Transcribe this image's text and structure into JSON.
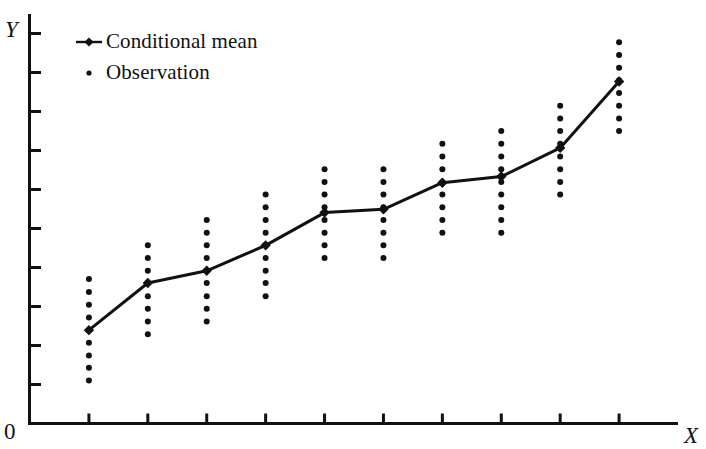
{
  "figure": {
    "axis_y_label": "Y",
    "axis_x_label": "X",
    "origin_label": "0"
  },
  "legend": {
    "position": "top-left inside plot",
    "items": [
      {
        "label": "Conditional mean",
        "marker": "line-with-diamond-marker",
        "color": "#111111"
      },
      {
        "label": "Observation",
        "marker": "small-dot",
        "color": "#111111"
      }
    ]
  },
  "chart_data": {
    "type": "scatter",
    "title": "",
    "subtitle": "",
    "xlabel": "X",
    "ylabel": "Y",
    "xlim": [
      0,
      11
    ],
    "ylim": [
      0,
      10
    ],
    "grid": false,
    "legend_position": "top-left",
    "axis_ticks_x_count": 10,
    "axis_ticks_y_count": 10,
    "axis_tick_labels_x": [],
    "axis_tick_labels_y": [],
    "annotations": [],
    "categories": [
      1,
      2,
      3,
      4,
      5,
      6,
      7,
      8,
      9,
      10
    ],
    "series": [
      {
        "name": "Conditional mean",
        "type": "line",
        "marker": "diamond",
        "color": "#111111",
        "values": [
          2.28,
          3.43,
          3.73,
          4.35,
          5.15,
          5.23,
          5.88,
          6.03,
          6.73,
          8.35
        ]
      },
      {
        "name": "Observation",
        "type": "scatter-column",
        "marker": "dot",
        "color": "#111111",
        "columns": [
          {
            "x": 1,
            "y_min": 1.05,
            "y_max": 3.53,
            "count": 9,
            "values": [
              1.05,
              1.36,
              1.66,
              1.97,
              2.28,
              2.59,
              2.9,
              3.21,
              3.53
            ]
          },
          {
            "x": 2,
            "y_min": 2.18,
            "y_max": 4.35,
            "count": 8,
            "values": [
              2.18,
              2.49,
              2.8,
              3.11,
              3.43,
              3.73,
              4.04,
              4.35
            ]
          },
          {
            "x": 3,
            "y_min": 2.49,
            "y_max": 4.97,
            "count": 9,
            "values": [
              2.49,
              2.8,
              3.11,
              3.43,
              3.73,
              4.04,
              4.35,
              4.66,
              4.97
            ]
          },
          {
            "x": 4,
            "y_min": 3.11,
            "y_max": 5.59,
            "count": 9,
            "values": [
              3.11,
              3.43,
              3.73,
              4.04,
              4.35,
              4.66,
              4.97,
              5.28,
              5.59
            ]
          },
          {
            "x": 5,
            "y_min": 4.04,
            "y_max": 6.21,
            "count": 8,
            "values": [
              4.04,
              4.35,
              4.66,
              4.97,
              5.28,
              5.59,
              5.9,
              6.21
            ]
          },
          {
            "x": 6,
            "y_min": 4.04,
            "y_max": 6.21,
            "count": 8,
            "values": [
              4.04,
              4.35,
              4.66,
              4.97,
              5.28,
              5.59,
              5.9,
              6.21
            ]
          },
          {
            "x": 7,
            "y_min": 4.66,
            "y_max": 6.83,
            "count": 8,
            "values": [
              4.66,
              4.97,
              5.28,
              5.59,
              5.9,
              6.21,
              6.52,
              6.83
            ]
          },
          {
            "x": 8,
            "y_min": 4.66,
            "y_max": 7.14,
            "count": 9,
            "values": [
              4.66,
              4.97,
              5.28,
              5.59,
              5.9,
              6.21,
              6.52,
              6.83,
              7.14
            ]
          },
          {
            "x": 9,
            "y_min": 5.59,
            "y_max": 7.76,
            "count": 8,
            "values": [
              5.59,
              5.9,
              6.21,
              6.52,
              6.83,
              7.14,
              7.45,
              7.76
            ]
          },
          {
            "x": 10,
            "y_min": 7.14,
            "y_max": 9.31,
            "count": 8,
            "values": [
              7.14,
              7.45,
              7.76,
              8.07,
              8.38,
              8.69,
              9.0,
              9.31
            ]
          }
        ]
      }
    ]
  },
  "style": {
    "background": "#ffffff",
    "ink": "#111111"
  }
}
